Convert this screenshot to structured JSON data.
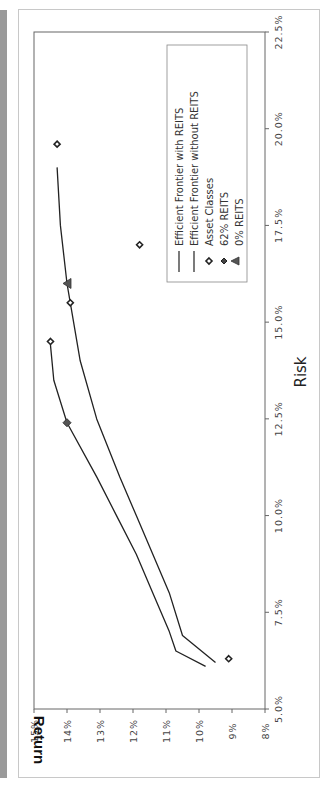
{
  "chart_data": {
    "type": "line",
    "orientation_note_rotation_deg": -90,
    "title": "",
    "xlabel": "Risk",
    "ylabel": "Return",
    "xlim": [
      5.0,
      22.5
    ],
    "ylim": [
      8,
      15
    ],
    "x_ticks": [
      "5.0%",
      "7.5%",
      "10.0%",
      "12.5%",
      "15.0%",
      "17.5%",
      "20.0%",
      "22.5%"
    ],
    "y_ticks": [
      "8%",
      "9%",
      "10%",
      "11%",
      "12%",
      "13%",
      "14%",
      "15%"
    ],
    "grid": false,
    "legend_position": "upper right",
    "series": [
      {
        "name": "Efficient  Frontier  with  REITS",
        "kind": "line",
        "color": "#222222",
        "points": [
          [
            6.1,
            9.8
          ],
          [
            6.5,
            10.7
          ],
          [
            7.0,
            10.9
          ],
          [
            8.0,
            11.4
          ],
          [
            9.0,
            11.9
          ],
          [
            10.0,
            12.5
          ],
          [
            11.0,
            13.1
          ],
          [
            12.4,
            14.0
          ],
          [
            13.5,
            14.4
          ],
          [
            14.4,
            14.5
          ],
          [
            14.5,
            14.5
          ]
        ]
      },
      {
        "name": "Efficient  Frontier  without  REITS",
        "kind": "line",
        "color": "#222222",
        "points": [
          [
            6.2,
            9.5
          ],
          [
            6.9,
            10.5
          ],
          [
            8.0,
            10.9
          ],
          [
            9.0,
            11.4
          ],
          [
            10.0,
            11.9
          ],
          [
            11.0,
            12.4
          ],
          [
            12.5,
            13.1
          ],
          [
            14.0,
            13.6
          ],
          [
            15.5,
            13.9
          ],
          [
            16.0,
            14.0
          ],
          [
            17.5,
            14.2
          ],
          [
            19.0,
            14.3
          ]
        ]
      },
      {
        "name": "Asset Classes",
        "kind": "scatter",
        "marker": "open-diamond",
        "points": [
          [
            6.3,
            9.1
          ],
          [
            14.5,
            14.5
          ],
          [
            15.5,
            13.9
          ],
          [
            17.0,
            11.8
          ],
          [
            19.6,
            14.3
          ]
        ]
      },
      {
        "name": "62%  REITS",
        "kind": "scatter",
        "marker": "filled-diamond",
        "points": [
          [
            12.4,
            14.0
          ]
        ]
      },
      {
        "name": "0%  REITS",
        "kind": "scatter",
        "marker": "filled-triangle",
        "points": [
          [
            16.0,
            14.0
          ]
        ]
      }
    ]
  },
  "legend": {
    "items": [
      {
        "label": "Efficient  Frontier  with  REITS"
      },
      {
        "label": "Efficient  Frontier  without  REITS"
      },
      {
        "label": "Asset Classes"
      },
      {
        "label": "62%  REITS"
      },
      {
        "label": "0%  REITS"
      }
    ]
  },
  "colors": {
    "line": "#222222",
    "marker_fill_filled": "#555555",
    "axis": "#666666",
    "side_bar": "#9a9a9a"
  }
}
